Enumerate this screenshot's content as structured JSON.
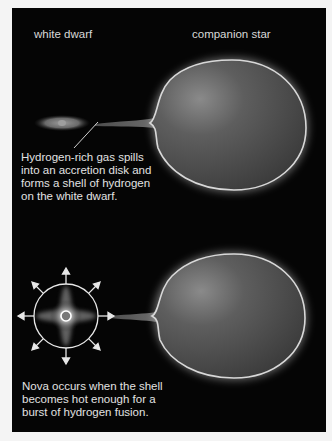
{
  "labels": {
    "white_dwarf": "white dwarf",
    "companion_star": "companion star"
  },
  "captions": {
    "accretion": "Hydrogen-rich gas spills\ninto an accretion disk and\nforms a shell of hydrogen\non the white dwarf.",
    "nova": "Nova occurs when the shell\nbecomes hot enough for a\nburst of hydrogen fusion."
  },
  "colors": {
    "background": "#050505",
    "star_body": "#555555",
    "star_rim": "#d0d0d0",
    "text": "#e0e0e0"
  }
}
